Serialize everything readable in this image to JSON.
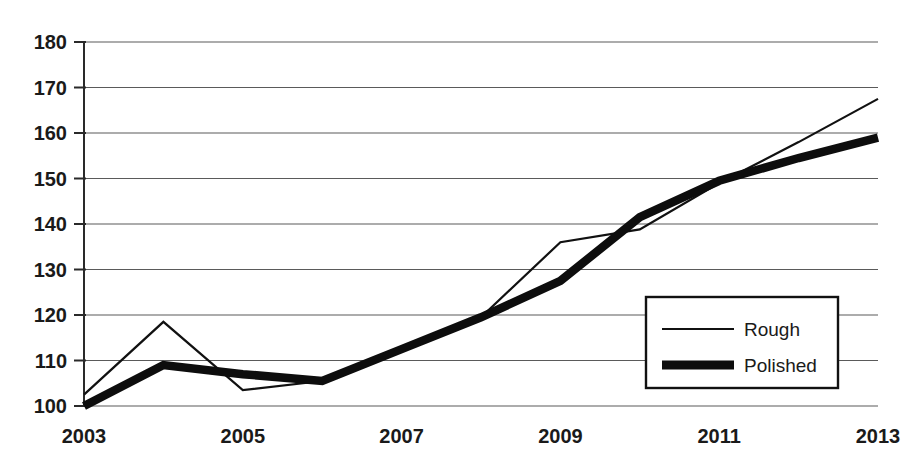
{
  "chart_data": {
    "type": "line",
    "title": "",
    "xlabel": "",
    "ylabel": "",
    "x": [
      2003,
      2004,
      2005,
      2006,
      2007,
      2008,
      2009,
      2010,
      2011,
      2012,
      2013
    ],
    "xlim": [
      2003,
      2013
    ],
    "ylim": [
      100,
      180
    ],
    "ytick_values": [
      100,
      110,
      120,
      130,
      140,
      150,
      160,
      170,
      180
    ],
    "ytick_labels": [
      "100",
      "110",
      "120",
      "130",
      "140",
      "150",
      "160",
      "170",
      "180"
    ],
    "xtick_values": [
      2003,
      2005,
      2007,
      2009,
      2011,
      2013
    ],
    "xtick_labels": [
      "2003",
      "2005",
      "2007",
      "2009",
      "2011",
      "2013"
    ],
    "grid": "horizontal",
    "legend_position": "lower-right-inside",
    "series": [
      {
        "name": "Rough",
        "style": "thin",
        "values": [
          102.5,
          118.5,
          103.5,
          105.5,
          112.0,
          119.5,
          136.0,
          138.8,
          149.0,
          158.0,
          167.5
        ]
      },
      {
        "name": "Polished",
        "style": "thick",
        "values": [
          100.0,
          109.0,
          107.0,
          105.5,
          112.5,
          119.5,
          127.5,
          141.5,
          149.5,
          154.5,
          159.0
        ]
      }
    ]
  },
  "legend": {
    "entries": [
      {
        "label": "Rough",
        "swatch": "thin-line-swatch"
      },
      {
        "label": "Polished",
        "swatch": "thick-line-swatch"
      }
    ]
  },
  "colors": {
    "rough_line": "#111111",
    "polished_line": "#0d0d0d",
    "gridline": "#5a5a5a",
    "axis": "#2a2a2a",
    "background": "#ffffff",
    "text": "#1a1a1a"
  }
}
